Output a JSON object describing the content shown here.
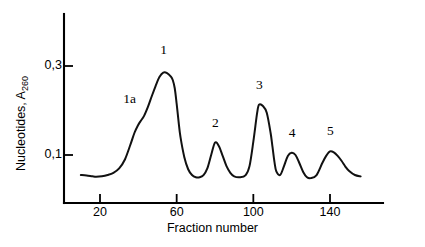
{
  "chart_data": {
    "type": "line",
    "title": "",
    "xlabel": "Fraction number",
    "ylabel": "Nucleotides, A",
    "ylabel_subscript": "260",
    "xlim": [
      10,
      157
    ],
    "ylim": [
      0.0,
      0.33
    ],
    "grid": false,
    "legend": null,
    "x_ticks": [
      {
        "value": 20,
        "label": "20"
      },
      {
        "value": 60,
        "label": "60"
      },
      {
        "value": 100,
        "label": "100"
      },
      {
        "value": 140,
        "label": "140"
      }
    ],
    "y_ticks": [
      {
        "value": 0.1,
        "label": "0,1"
      },
      {
        "value": 0.3,
        "label": "0,3"
      }
    ],
    "annotations": [
      {
        "text": "1a",
        "x": 41,
        "y": 0.175
      },
      {
        "text": "1",
        "x": 53,
        "y": 0.285
      },
      {
        "text": "2",
        "x": 80,
        "y": 0.128
      },
      {
        "text": "3",
        "x": 103,
        "y": 0.213
      },
      {
        "text": "4",
        "x": 120,
        "y": 0.105
      },
      {
        "text": "5",
        "x": 140,
        "y": 0.108
      }
    ],
    "peaks": [
      {
        "name": "1a",
        "fraction": 41,
        "absorbance": 0.175,
        "shape": "shoulder"
      },
      {
        "name": "1",
        "fraction": 53,
        "absorbance": 0.285,
        "shape": "peak"
      },
      {
        "name": "2",
        "fraction": 80,
        "absorbance": 0.128,
        "shape": "peak"
      },
      {
        "name": "3",
        "fraction": 103,
        "absorbance": 0.213,
        "shape": "peak"
      },
      {
        "name": "4",
        "fraction": 120,
        "absorbance": 0.105,
        "shape": "peak"
      },
      {
        "name": "5",
        "fraction": 140,
        "absorbance": 0.108,
        "shape": "peak"
      }
    ],
    "series": [
      {
        "name": "A260 absorbance",
        "color": "#111111",
        "x": [
          10,
          13,
          16,
          18,
          21,
          24,
          27,
          30,
          33,
          36,
          38,
          40,
          41,
          43,
          45,
          47,
          49,
          51,
          53,
          55,
          57,
          58,
          59,
          60,
          61,
          62,
          64,
          66,
          68,
          70,
          72,
          74,
          76,
          78,
          80,
          82,
          84,
          86,
          88,
          90,
          93,
          96,
          98,
          100,
          102,
          103,
          105,
          107,
          109,
          110,
          111,
          112,
          114,
          116,
          118,
          120,
          122,
          124,
          126,
          128,
          130,
          133,
          136,
          138,
          140,
          142,
          144,
          146,
          148,
          150,
          153,
          156
        ],
        "y": [
          0.055,
          0.054,
          0.052,
          0.051,
          0.052,
          0.055,
          0.06,
          0.07,
          0.09,
          0.125,
          0.15,
          0.168,
          0.175,
          0.188,
          0.208,
          0.232,
          0.255,
          0.275,
          0.285,
          0.284,
          0.276,
          0.268,
          0.25,
          0.215,
          0.175,
          0.14,
          0.095,
          0.068,
          0.055,
          0.05,
          0.05,
          0.055,
          0.07,
          0.1,
          0.128,
          0.12,
          0.098,
          0.075,
          0.06,
          0.052,
          0.05,
          0.055,
          0.075,
          0.13,
          0.195,
          0.213,
          0.21,
          0.195,
          0.15,
          0.118,
          0.085,
          0.063,
          0.055,
          0.075,
          0.098,
          0.105,
          0.1,
          0.082,
          0.062,
          0.05,
          0.048,
          0.055,
          0.082,
          0.098,
          0.108,
          0.106,
          0.098,
          0.087,
          0.074,
          0.064,
          0.055,
          0.052
        ]
      }
    ]
  }
}
